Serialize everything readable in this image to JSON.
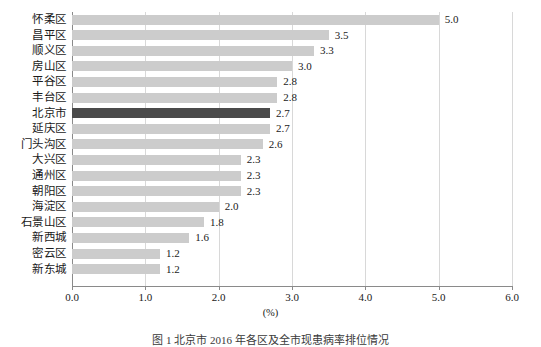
{
  "chart_data": {
    "type": "bar",
    "orientation": "horizontal",
    "title": "",
    "xlabel": "(%)",
    "ylabel": "",
    "xlim": [
      0.0,
      6.0
    ],
    "xticks": [
      "0.0",
      "1.0",
      "2.0",
      "3.0",
      "4.0",
      "5.0",
      "6.0"
    ],
    "xtick_values": [
      0.0,
      1.0,
      2.0,
      3.0,
      4.0,
      5.0,
      6.0
    ],
    "grid": true,
    "legend": false,
    "categories": [
      "怀柔区",
      "昌平区",
      "顺义区",
      "房山区",
      "平谷区",
      "丰台区",
      "北京市",
      "延庆区",
      "门头沟区",
      "大兴区",
      "通州区",
      "朝阳区",
      "海淀区",
      "石景山区",
      "新西城",
      "密云区",
      "新东城"
    ],
    "values": [
      5.0,
      3.5,
      3.3,
      3.0,
      2.8,
      2.8,
      2.7,
      2.7,
      2.6,
      2.3,
      2.3,
      2.3,
      2.0,
      1.8,
      1.6,
      1.2,
      1.2
    ],
    "value_labels": [
      "5.0",
      "3.5",
      "3.3",
      "3.0",
      "2.8",
      "2.8",
      "2.7",
      "2.7",
      "2.6",
      "2.3",
      "2.3",
      "2.3",
      "2.0",
      "1.8",
      "1.6",
      "1.2",
      "1.2"
    ],
    "highlight_index": 6,
    "colors": {
      "bar": "#cccccc",
      "bar_highlight": "#4a4a4a",
      "gridline": "#d8d8d8",
      "axis": "#8a8a8a",
      "text": "#1a1a1a"
    }
  },
  "caption": {
    "text": "图 1  北京市 2016 年各区及全市现患病率排位情况"
  }
}
